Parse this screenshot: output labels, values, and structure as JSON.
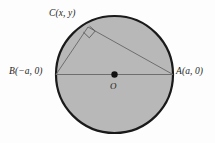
{
  "figure": {
    "background_color": "#fdfdfd",
    "circle": {
      "fill_color": "#b8b8b8",
      "stroke_color": "#1a1a1a",
      "center_label": "O",
      "center_x": 114.5,
      "center_y": 74.5,
      "radius": 58.5,
      "stroke_width": 2.2
    },
    "center_dot": {
      "radius": 3.2,
      "color": "#111111"
    },
    "diameter_endpoints": {
      "left": {
        "label": "B(−a, 0)",
        "x": 56,
        "y": 74.5
      },
      "right": {
        "label": "A(a, 0)",
        "x": 173,
        "y": 74.5
      }
    },
    "vertex_c": {
      "label": "C(x, y)",
      "x": 88,
      "y": 27
    },
    "segments": [
      {
        "name": "diameter-ba",
        "from": "B",
        "to": "A",
        "color": "#6e6e6e"
      },
      {
        "name": "chord-bc",
        "from": "B",
        "to": "C",
        "color": "#6e6e6e"
      },
      {
        "name": "chord-ca",
        "from": "C",
        "to": "A",
        "color": "#6e6e6e"
      }
    ],
    "right_angle_marker": {
      "name": "right-angle-square",
      "at_vertex": "C",
      "size": 9,
      "color": "#5a5a5a"
    },
    "labels": {
      "c": "C(x, y)",
      "b": "B(−a, 0)",
      "a": "A(a, 0)",
      "o": "O"
    }
  }
}
